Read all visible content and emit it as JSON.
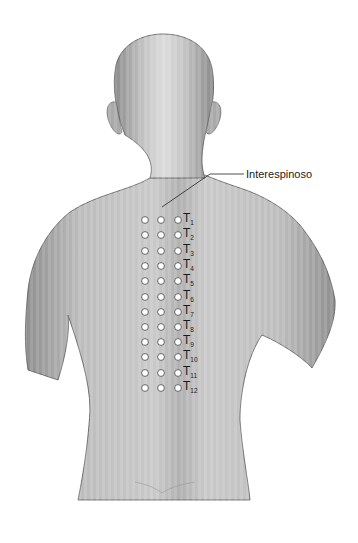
{
  "figure": {
    "callout": {
      "label": "Interespinoso",
      "x": 245,
      "y": 168
    },
    "colors": {
      "skin_light": "#d6d6d6",
      "skin_mid": "#b4b4b4",
      "skin_dark": "#8c8c8c",
      "outline": "#4a4a4a",
      "dot_fill": "#ffffff",
      "dot_stroke": "#555555",
      "text": "#222222"
    },
    "dot_columns_x": [
      145,
      161,
      178
    ],
    "vertebrae": [
      {
        "letter": "T",
        "num": "1",
        "y": 220
      },
      {
        "letter": "T",
        "num": "2",
        "y": 235
      },
      {
        "letter": "T",
        "num": "3",
        "y": 251
      },
      {
        "letter": "T",
        "num": "4",
        "y": 266
      },
      {
        "letter": "T",
        "num": "5",
        "y": 281
      },
      {
        "letter": "T",
        "num": "6",
        "y": 297
      },
      {
        "letter": "T",
        "num": "7",
        "y": 312
      },
      {
        "letter": "T",
        "num": "8",
        "y": 327
      },
      {
        "letter": "T",
        "num": "9",
        "y": 342
      },
      {
        "letter": "T",
        "num": "10",
        "y": 357
      },
      {
        "letter": "T",
        "num": "11",
        "y": 373
      },
      {
        "letter": "T",
        "num": "12",
        "y": 388
      }
    ]
  }
}
